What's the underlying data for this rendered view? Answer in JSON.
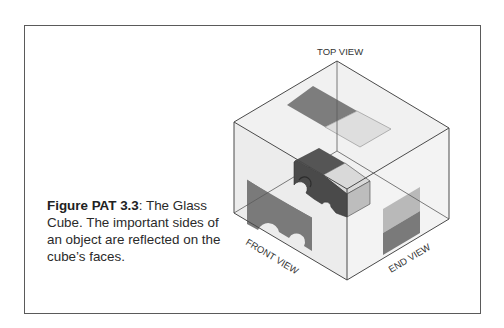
{
  "figure": {
    "caption_bold": "Figure PAT 3.3",
    "caption_rest": ": The Glass Cube. The important sides of an object are reflected on the cube’s faces."
  },
  "diagram": {
    "title": "The Glass Cube",
    "labels": {
      "top": "TOP VIEW",
      "front": "FRONT VIEW",
      "end": "END VIEW"
    },
    "colors": {
      "border": "#5a5a5a",
      "edge": "#4a4a4a",
      "glass": "#efefef",
      "object_dark": "#4a4a4a",
      "object_mid": "#6e6e6e",
      "object_light": "#dcdcdc",
      "projection_dark": "#7a7a7a",
      "projection_light": "#d8d8d8"
    }
  }
}
